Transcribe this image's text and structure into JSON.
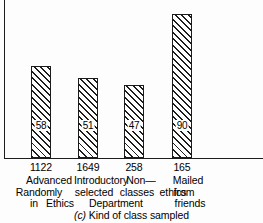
{
  "chart_data": {
    "type": "bar",
    "title": "(c) Kind of class sampled",
    "caption_tag": "(c)",
    "caption_text": "Kind of class sampled",
    "xlabel": "",
    "ylabel": "",
    "ylim": [
      0,
      100
    ],
    "grid": false,
    "legend": "none",
    "categories": [
      "1122",
      "1649",
      "258",
      "165"
    ],
    "values": [
      58,
      51,
      47,
      90
    ],
    "value_labels": [
      "58",
      "51",
      "47",
      "90"
    ],
    "tick_labels": [
      "1122",
      "1649",
      "258",
      "165"
    ],
    "category_descriptions": [
      "Advanced Randomly selected in Ethics",
      "Introductory selected classes Department",
      "Non-ethics",
      "Mailed from friends"
    ],
    "label_grid": {
      "line1": [
        "Advanced",
        "Introductory",
        "Non—",
        "Mailed"
      ],
      "line2": [
        "Randomly",
        "selected",
        "classes",
        "ethics",
        "from"
      ],
      "line3": [
        "in",
        "Ethics",
        "Department",
        "friends"
      ]
    },
    "bar_fill": "diagonal-hatch",
    "bar_color": "#1d1d1d",
    "axis_color": "#1c1c1c"
  },
  "labels": {
    "row1": [
      {
        "text": "Advanced",
        "left": 18,
        "width": 62
      },
      {
        "text": "Introductory",
        "left": 62,
        "width": 78
      },
      {
        "text": "Non—",
        "left": 119,
        "width": 44
      },
      {
        "text": "Mailed",
        "left": 165,
        "width": 46
      }
    ],
    "row2": [
      {
        "text": "Randomly",
        "left": 7,
        "width": 64
      },
      {
        "text": "selected",
        "left": 67,
        "width": 54
      },
      {
        "text": "classes",
        "left": 112,
        "width": 50
      },
      {
        "text": "ethics",
        "left": 152,
        "width": 42
      },
      {
        "text": "from",
        "left": 166,
        "width": 36
      }
    ],
    "row3": [
      {
        "text": "in",
        "left": 26,
        "width": 16
      },
      {
        "text": "Ethics",
        "left": 38,
        "width": 44
      },
      {
        "text": "Department",
        "left": 78,
        "width": 76
      },
      {
        "text": "friends",
        "left": 165,
        "width": 50
      }
    ]
  },
  "bars": [
    {
      "value_label": "58",
      "left": 31,
      "width": 20,
      "top": 66,
      "height": 92,
      "tick": "1122",
      "tick_left": 11,
      "tick_width": 60
    },
    {
      "value_label": "51",
      "left": 78,
      "width": 20,
      "top": 78,
      "height": 80,
      "tick": "1649",
      "tick_left": 58,
      "tick_width": 60
    },
    {
      "value_label": "47",
      "left": 124,
      "width": 20,
      "top": 85,
      "height": 73,
      "tick": "258",
      "tick_left": 104,
      "tick_width": 60
    },
    {
      "value_label": "90",
      "left": 172,
      "width": 20,
      "top": 14,
      "height": 144,
      "tick": "165",
      "tick_left": 152,
      "tick_width": 60
    }
  ]
}
